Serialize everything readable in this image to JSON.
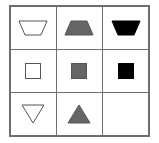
{
  "puzzle": {
    "rows": 3,
    "cols": 3,
    "colors": {
      "outline": "#555555",
      "white": "#ffffff",
      "gray": "#666666",
      "black": "#000000"
    },
    "cells": [
      {
        "shape": "inverted-trapezoid",
        "fill": "white"
      },
      {
        "shape": "trapezoid",
        "fill": "gray"
      },
      {
        "shape": "inverted-trapezoid",
        "fill": "black"
      },
      {
        "shape": "square",
        "fill": "white"
      },
      {
        "shape": "square",
        "fill": "gray"
      },
      {
        "shape": "square",
        "fill": "black"
      },
      {
        "shape": "inverted-triangle",
        "fill": "white"
      },
      {
        "shape": "triangle",
        "fill": "gray"
      },
      {
        "shape": "empty",
        "fill": "none"
      }
    ]
  }
}
